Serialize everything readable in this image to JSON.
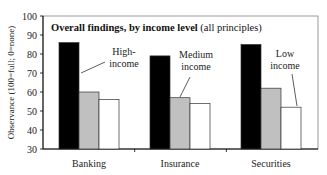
{
  "chart_data": {
    "type": "bar",
    "title": "Overall findings, by income level",
    "subtitle": "(all principles)",
    "ylabel": "Observance (100=full; 0=none)",
    "xlabel": "",
    "ylim": [
      30,
      100
    ],
    "yticks": [
      30,
      40,
      50,
      60,
      70,
      80,
      90,
      100
    ],
    "grid": false,
    "categories": [
      "Banking",
      "Insurance",
      "Securities"
    ],
    "series": [
      {
        "name": "High-income",
        "color": "#000000",
        "values": [
          86,
          79,
          85
        ]
      },
      {
        "name": "Medium income",
        "color": "#c0c0c0",
        "values": [
          60,
          57,
          62
        ]
      },
      {
        "name": "Low income",
        "color": "#ffffff",
        "values": [
          56,
          54,
          52
        ]
      }
    ],
    "annotations": [
      {
        "line1": "High-",
        "line2": "income",
        "series": 0
      },
      {
        "line1": "Medium",
        "line2": "income",
        "series": 1
      },
      {
        "line1": "Low",
        "line2": "income",
        "series": 2
      }
    ]
  }
}
